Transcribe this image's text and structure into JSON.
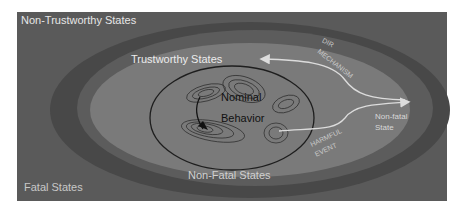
{
  "diagram": {
    "colors": {
      "background": "#ffffff",
      "fatal_region": "#5a5a5a",
      "nontrust_band": "#4a4a4a",
      "nonfatal_ring": "#6e6e6e",
      "trustworthy": "#7a7a7a",
      "label_light": "#e8e8e8",
      "label_dim": "#c4c4c4",
      "arrow": "#dcdcdc",
      "contour": "#2a2a2a"
    },
    "labels": {
      "non_trustworthy": "Non-Trustworthy States",
      "trustworthy": "Trustworthy States",
      "nominal_line1": "Nominal",
      "nominal_line2": "Behavior",
      "dir_line1": "DIR",
      "dir_line2": "MECHANISM",
      "harmful_line1": "HARMFUL",
      "harmful_line2": "EVENT",
      "nonfatal_state_line1": "Non-fatal",
      "nonfatal_state_line2": "State",
      "non_fatal": "Non-Fatal States",
      "fatal": "Fatal States"
    }
  }
}
